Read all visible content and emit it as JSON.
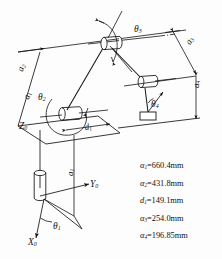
{
  "figure": {
    "type": "kinematic-schematic",
    "background_color": "#fdfdfd",
    "ink_color": "#141414"
  },
  "joint_labels": [
    {
      "id": "theta1",
      "text": "θ1",
      "glyph": "θ",
      "sub": "1"
    },
    {
      "id": "theta2",
      "text": "θ2",
      "glyph": "θ",
      "sub": "2"
    },
    {
      "id": "theta3",
      "text": "θ3",
      "glyph": "θ",
      "sub": "3"
    },
    {
      "id": "theta4",
      "text": "θ4",
      "glyph": "θ",
      "sub": "4"
    }
  ],
  "dimension_labels": [
    {
      "id": "a1-diagonal",
      "glyph": "a",
      "sub": "1"
    },
    {
      "id": "a2-diagonal",
      "glyph": "a",
      "sub": "2"
    },
    {
      "id": "a1-vertical",
      "glyph": "a",
      "sub": "1"
    },
    {
      "id": "a3-right",
      "glyph": "a",
      "sub": "3"
    },
    {
      "id": "a4-right",
      "glyph": "a",
      "sub": "4"
    },
    {
      "id": "d1",
      "glyph": "d",
      "sub": "1"
    }
  ],
  "axes": [
    {
      "id": "x0",
      "glyph": "X",
      "sub": "0"
    },
    {
      "id": "y0",
      "glyph": "Y",
      "sub": "0"
    },
    {
      "id": "z0",
      "glyph": "Z",
      "sub": "0"
    }
  ],
  "legend": {
    "rows": [
      {
        "symbol": "α",
        "sub": "1",
        "value": "660.4",
        "unit": "mm"
      },
      {
        "symbol": "α",
        "sub": "2",
        "value": "431.8",
        "unit": "mm"
      },
      {
        "symbol": "d",
        "sub": "1",
        "value": "149.1",
        "unit": "mm"
      },
      {
        "symbol": "α",
        "sub": "3",
        "value": "254.0",
        "unit": "mm"
      },
      {
        "symbol": "α",
        "sub": "4",
        "value": "196.85",
        "unit": "mm"
      }
    ]
  }
}
